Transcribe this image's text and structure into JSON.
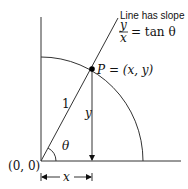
{
  "diagram": {
    "caption_line1": "Line has slope",
    "slope_numerator": "y",
    "slope_denominator": "x",
    "slope_rhs": "= tan θ",
    "point_label": "P = (x, y)",
    "origin_label": "(0, 0)",
    "hypotenuse_label": "1",
    "vertical_label": "y",
    "horizontal_label": "x",
    "angle_label": "θ"
  }
}
